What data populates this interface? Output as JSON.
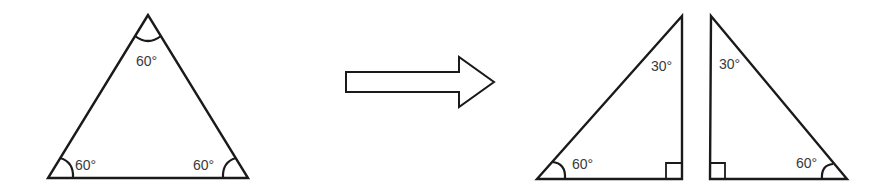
{
  "diagram": {
    "stroke_color": "#1a1a1a",
    "label_color": "#3a3a3a",
    "equilateral_triangle": {
      "angles": [
        {
          "position": "top",
          "label": "60°"
        },
        {
          "position": "bottom-left",
          "label": "60°"
        },
        {
          "position": "bottom-right",
          "label": "60°"
        }
      ]
    },
    "arrow": {
      "direction": "right",
      "style": "hollow"
    },
    "right_triangle_left": {
      "angles": [
        {
          "position": "top",
          "label": "30°"
        },
        {
          "position": "bottom-left",
          "label": "60°"
        },
        {
          "position": "bottom-right",
          "label": "right-angle"
        }
      ]
    },
    "right_triangle_right": {
      "angles": [
        {
          "position": "top",
          "label": "30°"
        },
        {
          "position": "bottom-right",
          "label": "60°"
        },
        {
          "position": "bottom-left",
          "label": "right-angle"
        }
      ]
    }
  }
}
